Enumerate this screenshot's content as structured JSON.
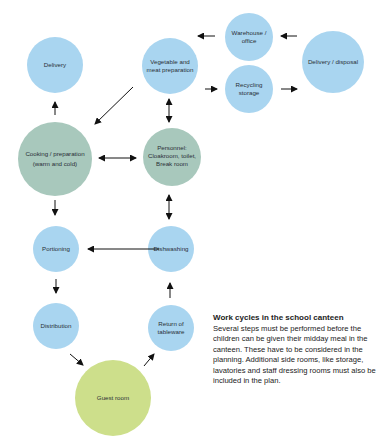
{
  "diagram": {
    "title": "Work cycles in the school canteen",
    "colors": {
      "blue": "#A9D5F0",
      "green": "#A8C8BC",
      "yellow_green": "#CDDF8B",
      "arrow": "#111111",
      "text": "#2a2f36"
    },
    "nodes": {
      "delivery": {
        "lines": [
          "Delivery"
        ]
      },
      "vegetable": {
        "lines": [
          "Vegetable and",
          "meat preparation"
        ]
      },
      "warehouse": {
        "lines": [
          "Warehouse /",
          "office"
        ]
      },
      "recycling": {
        "lines": [
          "Recycling",
          "storage"
        ]
      },
      "disposal": {
        "lines": [
          "Delivery / disposal"
        ]
      },
      "cooking": {
        "lines": [
          "Cooking / preparation",
          "(warm and cold)"
        ]
      },
      "personnel": {
        "lines": [
          "Personnel:",
          "Cloakroom, toilet,",
          "Break room"
        ]
      },
      "portioning": {
        "lines": [
          "Portioning"
        ]
      },
      "dishwashing": {
        "lines": [
          "Dishwashing"
        ]
      },
      "distribution": {
        "lines": [
          "Distribution"
        ]
      },
      "return": {
        "lines": [
          "Return of",
          "tableware"
        ]
      },
      "guest": {
        "lines": [
          "Guest room"
        ]
      }
    },
    "edges": [
      {
        "from": "disposal",
        "to": "warehouse",
        "type": "one-way"
      },
      {
        "from": "warehouse",
        "to": "vegetable",
        "type": "one-way"
      },
      {
        "from": "vegetable",
        "to": "recycling",
        "type": "one-way"
      },
      {
        "from": "recycling",
        "to": "disposal",
        "type": "one-way"
      },
      {
        "from": "vegetable",
        "to": "cooking",
        "type": "one-way"
      },
      {
        "from": "vegetable",
        "to": "personnel",
        "type": "two-way"
      },
      {
        "from": "cooking",
        "to": "delivery",
        "type": "one-way"
      },
      {
        "from": "cooking",
        "to": "personnel",
        "type": "two-way"
      },
      {
        "from": "cooking",
        "to": "portioning",
        "type": "one-way"
      },
      {
        "from": "personnel",
        "to": "dishwashing",
        "type": "two-way"
      },
      {
        "from": "dishwashing",
        "to": "portioning",
        "type": "one-way"
      },
      {
        "from": "portioning",
        "to": "distribution",
        "type": "one-way"
      },
      {
        "from": "distribution",
        "to": "guest",
        "type": "one-way"
      },
      {
        "from": "guest",
        "to": "return",
        "type": "one-way"
      },
      {
        "from": "return",
        "to": "dishwashing",
        "type": "one-way"
      }
    ]
  },
  "caption": {
    "title": "Work cycles in the school canteen",
    "body": "Several steps must be performed before the children can be given their midday meal in the canteen. These have to be considered in the planning. Additional side rooms, like storage, lavatories and staff dressing rooms must also be included in the plan."
  }
}
